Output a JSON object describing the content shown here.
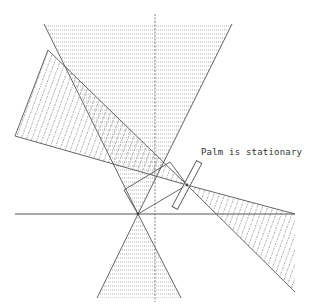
{
  "diagram": {
    "annotation": "Palm is stationary",
    "colors": {
      "line": "#555555",
      "hatch": "#8a8a8a",
      "background": "#ffffff"
    },
    "elements": [
      "vertical-axis",
      "horizontal-axis",
      "top-cone-horizontal-hatch",
      "bottom-cone-horizontal-hatch",
      "reflected-beam-diagonal-hatch",
      "palm-rectangle",
      "light-rays"
    ]
  }
}
